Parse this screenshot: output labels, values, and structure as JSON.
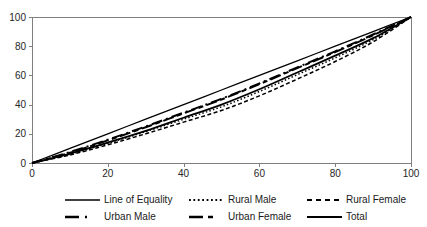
{
  "chart_data": {
    "type": "line",
    "title": "",
    "subtitle": "",
    "xlabel": "",
    "ylabel": "",
    "xlim": [
      0,
      100
    ],
    "ylim": [
      0,
      100
    ],
    "x_ticks": [
      0,
      20,
      40,
      60,
      80,
      100
    ],
    "y_ticks": [
      0,
      20,
      40,
      60,
      80,
      100
    ],
    "grid": false,
    "legend_position": "bottom",
    "plot_border": true,
    "line_color": "#000000",
    "axis_color": "#7f7f7f",
    "label_color": "#262626",
    "x": [
      0,
      10,
      20,
      30,
      40,
      50,
      60,
      70,
      80,
      90,
      100
    ],
    "series": [
      {
        "name": "Line of Equality",
        "style": "solid",
        "stroke_width": 1.3,
        "dash": "",
        "legend_dash": "",
        "values": [
          0,
          10,
          20,
          30,
          40,
          50,
          60,
          70,
          80,
          90,
          100
        ]
      },
      {
        "name": "Rural Male",
        "style": "dotted",
        "stroke_width": 1.5,
        "dash": "1.5 2.2",
        "legend_dash": "1.8 2.6",
        "values": [
          0,
          6,
          13.5,
          21.5,
          30,
          38.5,
          49,
          60.5,
          72,
          84.5,
          100
        ]
      },
      {
        "name": "Rural Female",
        "style": "dashed",
        "stroke_width": 1.5,
        "dash": "4 2.5",
        "legend_dash": "5 4",
        "values": [
          0,
          5.5,
          12.5,
          20,
          28,
          36,
          46,
          57.5,
          69.5,
          83,
          100
        ]
      },
      {
        "name": "Urban Male",
        "style": "dash-dot",
        "stroke_width": 2,
        "dash": "11 4 2 4",
        "legend_dash": "14 6 2 30",
        "values": [
          0,
          7.5,
          16,
          25,
          34.5,
          44,
          54.5,
          65.5,
          76.5,
          88,
          100
        ]
      },
      {
        "name": "Urban Female",
        "style": "long-dash-short-dash",
        "stroke_width": 2,
        "dash": "11 3.5 5 3.5",
        "legend_dash": "14 5 5 30",
        "values": [
          0,
          7,
          15.5,
          24.5,
          34,
          43.5,
          54,
          65,
          76,
          87.5,
          100
        ]
      },
      {
        "name": "Total",
        "style": "solid",
        "stroke_width": 1.8,
        "dash": "",
        "legend_dash": "",
        "values": [
          0,
          6.5,
          14,
          22,
          31,
          40,
          50.5,
          62,
          73.5,
          85.5,
          100
        ]
      }
    ]
  }
}
